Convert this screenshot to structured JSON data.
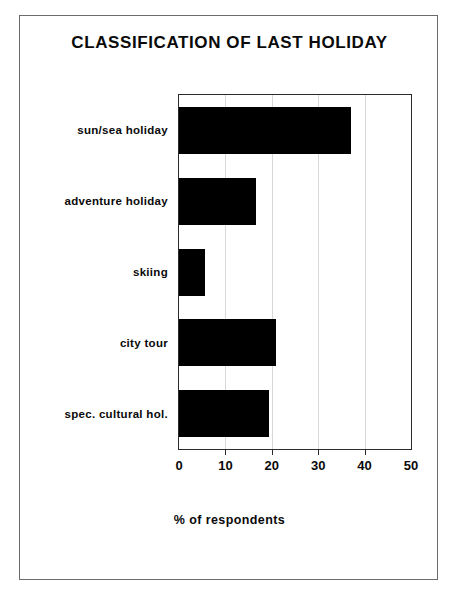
{
  "figure": {
    "title": "CLASSIFICATION OF LAST HOLIDAY",
    "xaxis_title": "% of respondents"
  },
  "chart_data": {
    "type": "bar",
    "orientation": "horizontal",
    "title": "CLASSIFICATION OF LAST HOLIDAY",
    "xlabel": "% of respondents",
    "ylabel": "",
    "categories": [
      "sun/sea holiday",
      "adventure holiday",
      "skiing",
      "city tour",
      "spec. cultural hol."
    ],
    "values": [
      37,
      16.5,
      5.5,
      21,
      19.5
    ],
    "xlim": [
      0,
      50
    ],
    "xticks": [
      0,
      10,
      20,
      30,
      40,
      50
    ],
    "xtick_labels": [
      "0",
      "10",
      "20",
      "30",
      "40",
      "50"
    ],
    "grid": true,
    "grid_axis": "x",
    "legend": false,
    "bar_color": "#000000"
  }
}
